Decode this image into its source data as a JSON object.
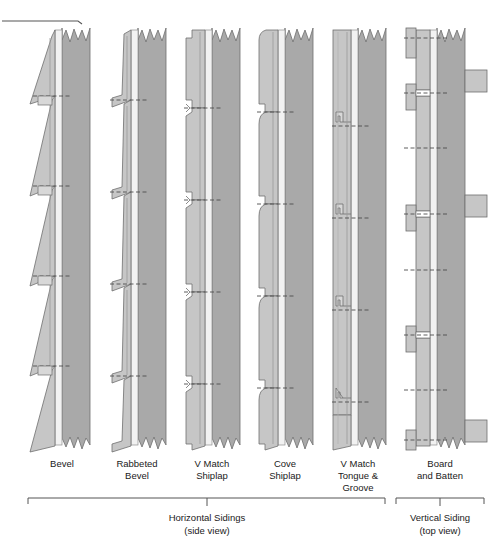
{
  "figure": {
    "background_color": "#ffffff",
    "colors": {
      "wall_sheathing": "#a9a9a9",
      "board_face": "#c6c6c6",
      "board_light": "#d8d8d8",
      "board_edge": "#8f8f8f",
      "air_gap": "#f2f2f2",
      "outline": "#6e6e6e",
      "dash_line": "#4d4d4d",
      "text": "#1a1a1a",
      "leader_line": "#555555"
    }
  },
  "leader": {
    "name": "top-left-leader-line",
    "visible": true
  },
  "profiles": [
    {
      "id": "bevel",
      "label_lines": [
        "Bevel"
      ],
      "label_x": 62,
      "center_x": 55,
      "group": "horizontal",
      "description": "Tapered boards lapped over one another"
    },
    {
      "id": "rabbeted-bevel",
      "label_lines": [
        "Rabbeted",
        "Bevel"
      ],
      "label_x": 137,
      "center_x": 133,
      "group": "horizontal",
      "description": "Tapered boards with rabbeted edge for flat lap"
    },
    {
      "id": "v-match-shiplap",
      "label_lines": [
        "V Match",
        "Shiplap"
      ],
      "label_x": 212,
      "center_x": 208,
      "group": "horizontal",
      "description": "Flat boards with shiplap rabbet and V groove joint"
    },
    {
      "id": "cove-shiplap",
      "label_lines": [
        "Cove",
        "Shiplap"
      ],
      "label_x": 285,
      "center_x": 281,
      "group": "horizontal",
      "description": "Flat boards with shiplap rabbet and concave cove joint"
    },
    {
      "id": "v-match-tongue-and-groove",
      "label_lines": [
        "V Match",
        "Tongue &",
        "Groove"
      ],
      "label_x": 358,
      "center_x": 354,
      "group": "horizontal",
      "description": "Boards with interlocking tongue and groove and V joint"
    },
    {
      "id": "board-and-batten",
      "label_lines": [
        "Board",
        "and Batten"
      ],
      "label_x": 440,
      "center_x": 437,
      "group": "vertical",
      "description": "Wide boards with narrow battens covering the joints"
    }
  ],
  "groups": [
    {
      "id": "horizontal-sidings",
      "label_lines": [
        "Horizontal Sidings",
        "(side view)"
      ],
      "bracket_x1": 28,
      "bracket_x2": 385,
      "bracket_y": 498,
      "label_x": 207,
      "label_y": 519
    },
    {
      "id": "vertical-siding",
      "label_lines": [
        "Vertical Siding",
        "(top view)"
      ],
      "bracket_x1": 396,
      "bracket_x2": 484,
      "bracket_y": 498,
      "label_x": 440,
      "label_y": 519
    }
  ]
}
